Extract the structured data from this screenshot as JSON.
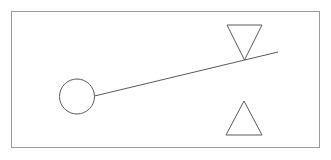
{
  "figure": {
    "canvas": {
      "width": 331,
      "height": 160,
      "background": "#ffffff"
    },
    "style": {
      "border_color": "#9a9a9a",
      "shape_stroke": "#5a5a5a",
      "line_stroke": "#5a5a5a",
      "fill": "none",
      "border_width": 1,
      "shape_width": 1,
      "line_width": 1
    },
    "border": {
      "x": 11,
      "y": 11,
      "width": 308,
      "height": 136
    },
    "shapes": [
      {
        "name": "circle-weight",
        "type": "circle",
        "cx": 77,
        "cy": 96.5,
        "r": 17.5
      },
      {
        "name": "lever-beam",
        "type": "line",
        "x1": 94.5,
        "y1": 96,
        "x2": 278,
        "y2": 52
      },
      {
        "name": "inverted-triangle",
        "type": "polygon",
        "points": "227,25 262,25 244.5,60"
      },
      {
        "name": "upright-triangle",
        "type": "polygon",
        "points": "244,101 262,135 226,135"
      }
    ]
  }
}
